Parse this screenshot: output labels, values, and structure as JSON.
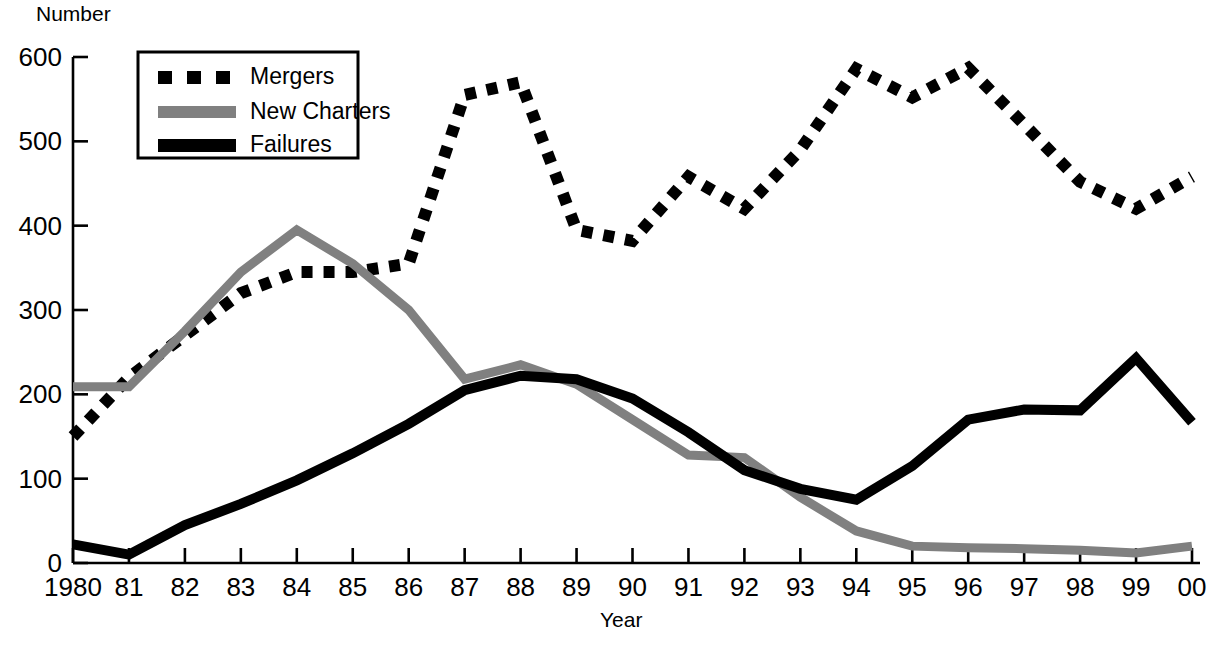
{
  "chart_data": {
    "type": "line",
    "title": "",
    "xlabel": "Year",
    "ylabel": "Number",
    "xlim": [
      1980,
      2000
    ],
    "ylim": [
      0,
      600
    ],
    "yticks": [
      0,
      100,
      200,
      300,
      400,
      500,
      600
    ],
    "ytick_labels": [
      "0",
      "100",
      "200",
      "300",
      "400",
      "500",
      "600"
    ],
    "xticks": [
      1980,
      1981,
      1982,
      1983,
      1984,
      1985,
      1986,
      1987,
      1988,
      1989,
      1990,
      1991,
      1992,
      1993,
      1994,
      1995,
      1996,
      1997,
      1998,
      1999,
      2000
    ],
    "xtick_labels": [
      "1980",
      "81",
      "82",
      "83",
      "84",
      "85",
      "86",
      "87",
      "88",
      "89",
      "90",
      "91",
      "92",
      "93",
      "94",
      "95",
      "96",
      "97",
      "98",
      "99",
      "00"
    ],
    "grid": false,
    "legend_position": "upper-left-inside",
    "x": [
      1980,
      1981,
      1982,
      1983,
      1984,
      1985,
      1986,
      1987,
      1988,
      1989,
      1990,
      1991,
      1992,
      1993,
      1994,
      1995,
      1996,
      1997,
      1998,
      1999,
      2000
    ],
    "series": [
      {
        "name": "Mergers",
        "style": "dotted",
        "color": "#000000",
        "values": [
          150,
          220,
          270,
          320,
          345,
          345,
          355,
          555,
          570,
          395,
          382,
          458,
          420,
          490,
          586,
          552,
          587,
          520,
          452,
          420,
          458
        ]
      },
      {
        "name": "New Charters",
        "style": "solid",
        "color": "#808080",
        "values": [
          209,
          209,
          275,
          345,
          395,
          355,
          300,
          218,
          235,
          212,
          170,
          128,
          125,
          78,
          38,
          20,
          18,
          17,
          15,
          12,
          20
        ]
      },
      {
        "name": "Failures",
        "style": "solid-bold",
        "color": "#000000",
        "values": [
          22,
          10,
          45,
          70,
          98,
          130,
          165,
          205,
          222,
          218,
          195,
          155,
          110,
          88,
          75,
          115,
          170,
          182,
          181,
          243,
          167
        ]
      }
    ],
    "legend": [
      {
        "label": "Mergers",
        "swatch": "dotted",
        "color": "#000000"
      },
      {
        "label": "New Charters",
        "swatch": "solid",
        "color": "#808080"
      },
      {
        "label": "Failures",
        "swatch": "solid-bold",
        "color": "#000000"
      }
    ]
  },
  "axes": {
    "y_axis_title": "Number",
    "x_axis_title": "Year"
  },
  "colors": {
    "axis": "#000000",
    "mergers": "#000000",
    "new_charters": "#808080",
    "failures": "#000000",
    "background": "#ffffff"
  }
}
